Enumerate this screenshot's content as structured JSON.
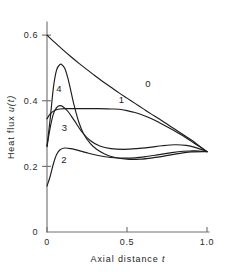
{
  "chart_data": {
    "type": "line",
    "title": "",
    "xlabel": "Axial distance t",
    "ylabel": "Heat flux u(t)",
    "xlim": [
      0.0,
      1.0
    ],
    "ylim": [
      0.0,
      0.64
    ],
    "grid": false,
    "legend_position": "inline-curve-labels",
    "x_ticks": [
      "0",
      "0.5",
      "1.0"
    ],
    "x_tick_values": [
      0.0,
      0.5,
      1.0
    ],
    "y_ticks": [
      "0",
      "0.2",
      "0.4",
      "0.6"
    ],
    "y_tick_values": [
      0.0,
      0.2,
      0.4,
      0.6
    ],
    "convergence_point": [
      1.0,
      0.245
    ],
    "series": [
      {
        "name": "0",
        "label": "0",
        "label_x": 0.63,
        "label_y": 0.452,
        "x": [
          0.0,
          0.05,
          0.1,
          0.15,
          0.2,
          0.25,
          0.3,
          0.35,
          0.4,
          0.45,
          0.5,
          0.55,
          0.6,
          0.65,
          0.7,
          0.75,
          0.8,
          0.85,
          0.9,
          0.95,
          1.0
        ],
        "values": [
          0.6,
          0.577,
          0.555,
          0.534,
          0.514,
          0.495,
          0.476,
          0.458,
          0.441,
          0.424,
          0.408,
          0.392,
          0.376,
          0.36,
          0.345,
          0.329,
          0.313,
          0.297,
          0.281,
          0.263,
          0.245
        ]
      },
      {
        "name": "1",
        "label": "1",
        "label_x": 0.465,
        "label_y": 0.405,
        "x": [
          0.0,
          0.02,
          0.05,
          0.08,
          0.12,
          0.18,
          0.25,
          0.32,
          0.4,
          0.45,
          0.5,
          0.55,
          0.6,
          0.65,
          0.7,
          0.75,
          0.8,
          0.85,
          0.9,
          0.95,
          1.0
        ],
        "values": [
          0.345,
          0.36,
          0.371,
          0.375,
          0.376,
          0.376,
          0.376,
          0.376,
          0.375,
          0.374,
          0.37,
          0.364,
          0.356,
          0.346,
          0.334,
          0.321,
          0.307,
          0.293,
          0.277,
          0.261,
          0.245
        ]
      },
      {
        "name": "2",
        "label": "2",
        "label_x": 0.105,
        "label_y": 0.222,
        "x": [
          0.0,
          0.02,
          0.04,
          0.06,
          0.08,
          0.11,
          0.15,
          0.2,
          0.26,
          0.32,
          0.4,
          0.48,
          0.55,
          0.62,
          0.7,
          0.78,
          0.85,
          0.9,
          0.95,
          1.0
        ],
        "values": [
          0.14,
          0.17,
          0.208,
          0.236,
          0.25,
          0.256,
          0.254,
          0.248,
          0.24,
          0.233,
          0.227,
          0.225,
          0.226,
          0.23,
          0.236,
          0.242,
          0.246,
          0.247,
          0.247,
          0.245
        ]
      },
      {
        "name": "3",
        "label": "3",
        "label_x": 0.108,
        "label_y": 0.318,
        "x": [
          0.0,
          0.02,
          0.04,
          0.06,
          0.08,
          0.1,
          0.13,
          0.17,
          0.22,
          0.27,
          0.33,
          0.4,
          0.48,
          0.56,
          0.64,
          0.72,
          0.8,
          0.87,
          0.93,
          1.0
        ],
        "values": [
          0.26,
          0.318,
          0.36,
          0.379,
          0.385,
          0.382,
          0.368,
          0.34,
          0.304,
          0.279,
          0.262,
          0.254,
          0.252,
          0.254,
          0.258,
          0.263,
          0.266,
          0.264,
          0.257,
          0.245
        ]
      },
      {
        "name": "4",
        "label": "4",
        "label_x": 0.075,
        "label_y": 0.438,
        "x": [
          0.0,
          0.02,
          0.04,
          0.06,
          0.08,
          0.09,
          0.11,
          0.13,
          0.15,
          0.17,
          0.2,
          0.23,
          0.27,
          0.31,
          0.36,
          0.42,
          0.5,
          0.58,
          0.66,
          0.74,
          0.82,
          0.9,
          1.0
        ],
        "values": [
          0.262,
          0.345,
          0.44,
          0.494,
          0.51,
          0.511,
          0.5,
          0.47,
          0.428,
          0.385,
          0.333,
          0.298,
          0.27,
          0.252,
          0.238,
          0.228,
          0.222,
          0.222,
          0.226,
          0.232,
          0.239,
          0.244,
          0.245
        ]
      }
    ]
  }
}
